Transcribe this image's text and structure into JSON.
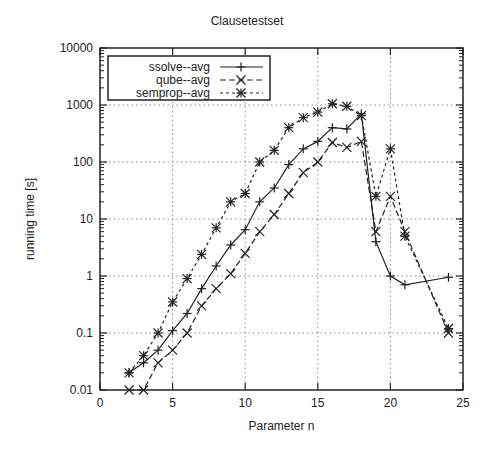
{
  "chart_data": {
    "type": "line",
    "title": "Clausetestset",
    "xlabel": "Parameter n",
    "ylabel": "running time [s]",
    "xlim": [
      0,
      25
    ],
    "ylim": [
      0.01,
      10000
    ],
    "yscale": "log",
    "grid": true,
    "legend_position": "upper left",
    "x_ticks": [
      0,
      5,
      10,
      15,
      20,
      25
    ],
    "y_ticks": [
      "0.01",
      "0.1",
      "1",
      "10",
      "100",
      "1000",
      "10000"
    ],
    "x": [
      2,
      3,
      4,
      5,
      6,
      7,
      8,
      9,
      10,
      11,
      12,
      13,
      14,
      15,
      16,
      17,
      18,
      19,
      20,
      21,
      24
    ],
    "series": [
      {
        "name": "ssolve--avg",
        "marker": "plus",
        "dash": "solid",
        "values": [
          0.02,
          0.03,
          0.05,
          0.11,
          0.22,
          0.6,
          1.5,
          3.5,
          6.5,
          20,
          35,
          90,
          170,
          230,
          400,
          380,
          700,
          4,
          1,
          0.7,
          0.95
        ]
      },
      {
        "name": "qube--avg",
        "marker": "cross",
        "dash": "dashed",
        "values": [
          0.01,
          0.01,
          0.03,
          0.05,
          0.1,
          0.3,
          0.6,
          1.1,
          2.5,
          6,
          12,
          28,
          65,
          100,
          220,
          180,
          230,
          6,
          25,
          6,
          0.1
        ]
      },
      {
        "name": "semprop--avg",
        "marker": "star",
        "dash": "dotted",
        "values": [
          0.02,
          0.04,
          0.1,
          0.35,
          0.9,
          2.4,
          7,
          20,
          28,
          100,
          160,
          400,
          600,
          750,
          1050,
          950,
          650,
          25,
          170,
          5,
          0.12
        ]
      }
    ]
  }
}
